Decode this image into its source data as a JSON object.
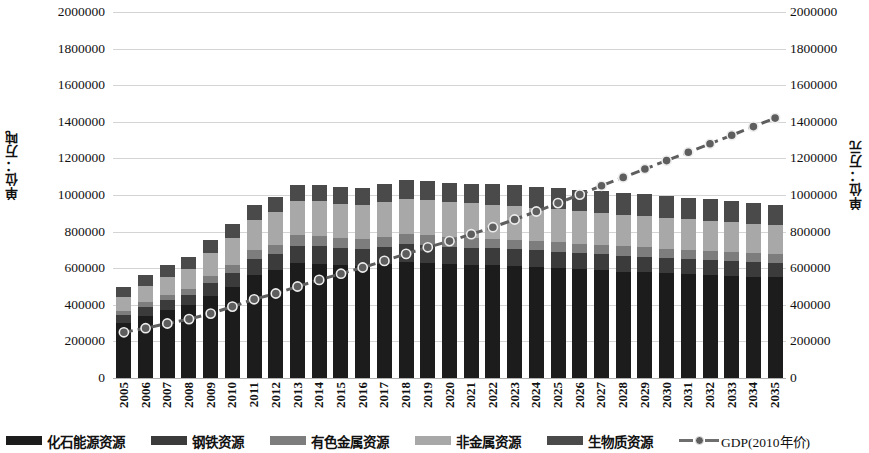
{
  "chart_data": {
    "type": "bar",
    "title": "",
    "subtitle": "",
    "xlabel": "",
    "ylabel": "单位：万吨",
    "y2label": "单位：万元",
    "grid": true,
    "legend_position": "bottom",
    "ylim": [
      0,
      2000000
    ],
    "y2lim": [
      0,
      2000000
    ],
    "ytick_labels": [
      "2000000",
      "1800000",
      "1600000",
      "1400000",
      "1200000",
      "1000000",
      "800000",
      "600000",
      "400000",
      "200000",
      "0"
    ],
    "ytick_values": [
      2000000,
      1800000,
      1600000,
      1400000,
      1200000,
      1000000,
      800000,
      600000,
      400000,
      200000,
      0
    ],
    "y2tick_labels": [
      "2000000",
      "1800000",
      "1600000",
      "1400000",
      "1200000",
      "1000000",
      "800000",
      "600000",
      "400000",
      "200000",
      "0"
    ],
    "categories": [
      "2005",
      "2006",
      "2007",
      "2008",
      "2009",
      "2010",
      "2011",
      "2012",
      "2013",
      "2014",
      "2015",
      "2016",
      "2017",
      "2018",
      "2019",
      "2020",
      "2021",
      "2022",
      "2023",
      "2024",
      "2025",
      "2026",
      "2027",
      "2028",
      "2029",
      "2030",
      "2031",
      "2032",
      "2033",
      "2034",
      "2035"
    ],
    "series": [
      {
        "name": "化石能源资源",
        "color": "#1c1c1c",
        "stack": "resources",
        "values": [
          300000,
          340000,
          372000,
          398000,
          450000,
          500000,
          562000,
          588000,
          628000,
          625000,
          616000,
          612000,
          622000,
          634000,
          630000,
          622000,
          618000,
          616000,
          612000,
          606000,
          600000,
          594000,
          588000,
          582000,
          578000,
          572000,
          566000,
          562000,
          558000,
          554000,
          550000
        ]
      },
      {
        "name": "钢铁资源",
        "color": "#3b3b3b",
        "stack": "resources",
        "values": [
          42000,
          48000,
          54000,
          58000,
          68000,
          76000,
          86000,
          90000,
          96000,
          96000,
          95000,
          94000,
          95000,
          97000,
          96000,
          95000,
          94000,
          93000,
          92000,
          91000,
          90000,
          89000,
          88000,
          87000,
          86000,
          85000,
          84000,
          83000,
          82000,
          81000,
          80000
        ]
      },
      {
        "name": "有色金属资源",
        "color": "#7d7d7d",
        "stack": "resources",
        "values": [
          24000,
          27000,
          30000,
          32000,
          38000,
          43000,
          49000,
          51000,
          55000,
          55000,
          54000,
          54000,
          55000,
          56000,
          55000,
          54000,
          54000,
          53000,
          53000,
          52000,
          52000,
          51000,
          51000,
          50000,
          50000,
          49000,
          49000,
          48000,
          48000,
          47000,
          46000
        ]
      },
      {
        "name": "非金属资源",
        "color": "#a8a8a8",
        "stack": "resources",
        "values": [
          76000,
          88000,
          98000,
          108000,
          126000,
          146000,
          168000,
          176000,
          190000,
          190000,
          188000,
          186000,
          190000,
          194000,
          192000,
          190000,
          188000,
          186000,
          184000,
          182000,
          180000,
          178000,
          176000,
          174000,
          172000,
          170000,
          168000,
          166000,
          164000,
          162000,
          160000
        ]
      },
      {
        "name": "生物质资源",
        "color": "#4a4a4a",
        "stack": "resources",
        "values": [
          58000,
          62000,
          66000,
          68000,
          72000,
          76000,
          80000,
          82000,
          86000,
          88000,
          90000,
          92000,
          96000,
          100000,
          104000,
          106000,
          108000,
          110000,
          112000,
          114000,
          116000,
          118000,
          118000,
          118000,
          118000,
          118000,
          118000,
          118000,
          116000,
          114000,
          112000
        ]
      },
      {
        "name": "GDP(2010年价)",
        "color": "#5e5e5e",
        "type": "line",
        "axis": "right",
        "values": [
          250000,
          272000,
          298000,
          322000,
          352000,
          390000,
          430000,
          462000,
          500000,
          536000,
          570000,
          604000,
          640000,
          678000,
          714000,
          748000,
          786000,
          824000,
          866000,
          910000,
          956000,
          1002000,
          1050000,
          1096000,
          1142000,
          1188000,
          1234000,
          1280000,
          1326000,
          1374000,
          1420000
        ]
      }
    ],
    "gdp_right_scale_values": [
      250000,
      272000,
      298000,
      322000,
      352000,
      390000,
      430000,
      462000,
      500000,
      536000,
      570000,
      604000,
      640000,
      678000,
      714000,
      748000,
      786000,
      824000,
      866000,
      910000,
      956000,
      1002000,
      1050000,
      1096000,
      1142000,
      1188000,
      1234000,
      1280000,
      1326000,
      1374000,
      1420000
    ]
  },
  "legend": {
    "items": [
      {
        "label": "化石能源资源",
        "marker": "swatch",
        "color": "#1c1c1c"
      },
      {
        "label": "钢铁资源",
        "marker": "swatch",
        "color": "#3b3b3b"
      },
      {
        "label": "有色金属资源",
        "marker": "swatch",
        "color": "#7d7d7d"
      },
      {
        "label": "非金属资源",
        "marker": "swatch",
        "color": "#a8a8a8"
      },
      {
        "label": "生物质资源",
        "marker": "swatch",
        "color": "#4a4a4a"
      },
      {
        "label": "GDP(2010年价)",
        "marker": "line-dot",
        "color": "#5e5e5e"
      }
    ]
  },
  "axes": {
    "left_title": "单位：万吨",
    "right_title": "单位：万元"
  }
}
